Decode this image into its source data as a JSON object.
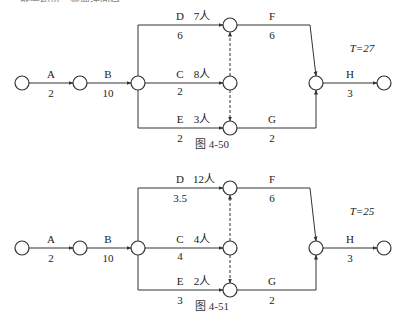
{
  "header": {
    "cut_text": "……就会较小，需要迂回全……。"
  },
  "diagrams": [
    {
      "id": "fig-4-50",
      "caption": "图   4-50",
      "total_time": "T=27",
      "rows": {
        "top": 25,
        "mid": 85,
        "bot": 128
      },
      "activities": [
        {
          "name": "A",
          "duration": "2"
        },
        {
          "name": "B",
          "duration": "10"
        },
        {
          "name": "D",
          "duration": "6",
          "workers": "7人"
        },
        {
          "name": "C",
          "duration": "2",
          "workers": "8人"
        },
        {
          "name": "E",
          "duration": "2",
          "workers": "3人"
        },
        {
          "name": "F",
          "duration": "6"
        },
        {
          "name": "G",
          "duration": "2"
        },
        {
          "name": "H",
          "duration": "3"
        }
      ]
    },
    {
      "id": "fig-4-51",
      "caption": "图   4-51",
      "total_time": "T=25",
      "rows": {
        "top": 188,
        "mid": 250,
        "bot": 290
      },
      "activities": [
        {
          "name": "A",
          "duration": "2"
        },
        {
          "name": "B",
          "duration": "10"
        },
        {
          "name": "D",
          "duration": "3.5",
          "workers": "12人"
        },
        {
          "name": "C",
          "duration": "4",
          "workers": "4人"
        },
        {
          "name": "E",
          "duration": "3",
          "workers": "2人"
        },
        {
          "name": "F",
          "duration": "6"
        },
        {
          "name": "G",
          "duration": "2"
        },
        {
          "name": "H",
          "duration": "3"
        }
      ]
    }
  ],
  "colors": {
    "line": "#333333",
    "node_fill": "#ffffff"
  }
}
